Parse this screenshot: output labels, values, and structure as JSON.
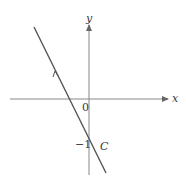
{
  "diagram": {
    "type": "coordinate-plane-line",
    "axes": {
      "x_label": "x",
      "y_label": "y",
      "origin_label": "0"
    },
    "curve": {
      "label": "C",
      "y_intercept_label": "−1",
      "direction": "up-left",
      "slope_sign": "negative"
    },
    "colors": {
      "stroke": "#555555",
      "text": "#3a3a3a",
      "background": "#ffffff"
    }
  }
}
